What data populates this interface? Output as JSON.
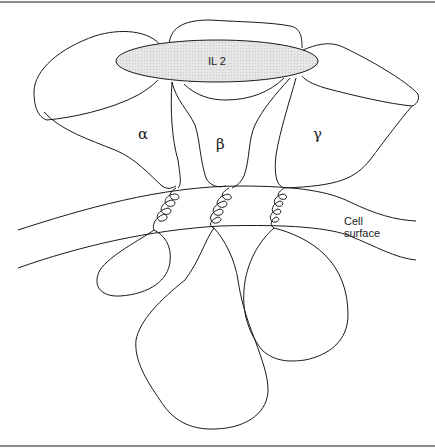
{
  "diagram": {
    "ligand": {
      "label": "IL 2",
      "fill": "#e4e4e4"
    },
    "subunits": [
      {
        "id": "alpha",
        "label": "α"
      },
      {
        "id": "beta",
        "label": "β"
      },
      {
        "id": "gamma",
        "label": "γ"
      }
    ],
    "membrane": {
      "label_line1": "Cell",
      "label_line2": "surface"
    }
  }
}
